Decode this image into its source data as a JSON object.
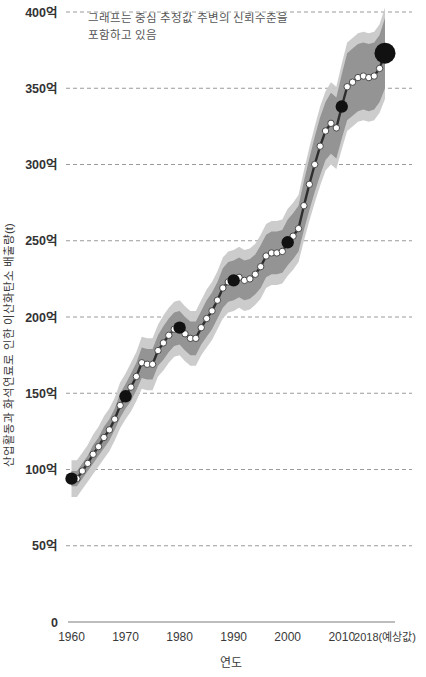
{
  "chart_data": {
    "type": "line",
    "title": "",
    "subtitle": "",
    "xlabel": "연도",
    "ylabel": "산업활동과 화석연료로 인한 이산화탄소 배출량(t)",
    "annotation": {
      "line1": "그래프는 중심 추정값 주변의 신뢰수준을",
      "line2": "포함하고 있음"
    },
    "grid": true,
    "legend_position": "none",
    "xlim": [
      1959,
      2019
    ],
    "ylim": [
      0,
      40000000000
    ],
    "y_unit": "억",
    "y_tick_labels": [
      "0",
      "50억",
      "100억",
      "150억",
      "200억",
      "250억",
      "300억",
      "350억",
      "400억"
    ],
    "y_tick_values": [
      0,
      5000000000,
      10000000000,
      15000000000,
      20000000000,
      25000000000,
      30000000000,
      35000000000,
      40000000000
    ],
    "x_tick_labels": [
      "1960",
      "1970",
      "1980",
      "1990",
      "2000",
      "2010",
      "2018(예상값)"
    ],
    "x_tick_values": [
      1960,
      1970,
      1980,
      1990,
      2000,
      2010,
      2018
    ],
    "series": [
      {
        "name": "중심 추정값",
        "unit": "억 t",
        "x": [
          1960,
          1961,
          1962,
          1963,
          1964,
          1965,
          1966,
          1967,
          1968,
          1969,
          1970,
          1971,
          1972,
          1973,
          1974,
          1975,
          1976,
          1977,
          1978,
          1979,
          1980,
          1981,
          1982,
          1983,
          1984,
          1985,
          1986,
          1987,
          1988,
          1989,
          1990,
          1991,
          1992,
          1993,
          1994,
          1995,
          1996,
          1997,
          1998,
          1999,
          2000,
          2001,
          2002,
          2003,
          2004,
          2005,
          2006,
          2007,
          2008,
          2009,
          2010,
          2011,
          2012,
          2013,
          2014,
          2015,
          2016,
          2017,
          2018
        ],
        "values": [
          94,
          94,
          99,
          104,
          110,
          115,
          121,
          126,
          133,
          142,
          148,
          154,
          161,
          170,
          169,
          169,
          178,
          183,
          188,
          192,
          193,
          189,
          186,
          186,
          193,
          199,
          204,
          211,
          219,
          223,
          224,
          226,
          224,
          225,
          228,
          233,
          240,
          242,
          242,
          243,
          249,
          253,
          258,
          273,
          287,
          300,
          312,
          322,
          327,
          324,
          338,
          351,
          354,
          357,
          358,
          357,
          358,
          363,
          373
        ],
        "confidence_low": [
          88,
          88,
          93,
          98,
          103,
          108,
          113,
          118,
          125,
          133,
          139,
          144,
          151,
          159,
          158,
          158,
          167,
          171,
          176,
          180,
          181,
          177,
          174,
          174,
          181,
          186,
          191,
          198,
          205,
          209,
          210,
          212,
          210,
          211,
          214,
          218,
          225,
          227,
          227,
          228,
          233,
          237,
          242,
          256,
          269,
          281,
          292,
          302,
          306,
          303,
          316,
          328,
          331,
          334,
          335,
          334,
          335,
          340,
          349
        ],
        "confidence_high": [
          100,
          100,
          105,
          110,
          117,
          122,
          129,
          134,
          141,
          151,
          157,
          164,
          171,
          181,
          180,
          180,
          189,
          195,
          200,
          204,
          205,
          201,
          198,
          198,
          205,
          212,
          217,
          224,
          233,
          237,
          238,
          240,
          238,
          239,
          242,
          248,
          255,
          257,
          257,
          258,
          265,
          269,
          274,
          290,
          305,
          319,
          332,
          342,
          348,
          345,
          360,
          374,
          377,
          380,
          381,
          380,
          381,
          386,
          397
        ]
      }
    ],
    "highlight_points": [
      {
        "x": 1960,
        "y": 94,
        "label": "1960"
      },
      {
        "x": 1970,
        "y": 148,
        "label": "1970"
      },
      {
        "x": 1980,
        "y": 193,
        "label": "1980"
      },
      {
        "x": 1990,
        "y": 224,
        "label": "1990"
      },
      {
        "x": 2000,
        "y": 249,
        "label": "2000"
      },
      {
        "x": 2010,
        "y": 338,
        "label": "2010"
      },
      {
        "x": 2018,
        "y": 373,
        "label": "2018"
      }
    ],
    "colors": {
      "band_outer": "#c9c9c9",
      "band_inner": "#909090",
      "line": "#2e2e2e",
      "point_fill": "#ffffff",
      "point_stroke": "#3a3a3a",
      "highlight_fill": "#111111",
      "grid": "#9a9a9a",
      "axis": "#7d7d7d",
      "text": "#3a3a3a"
    }
  }
}
